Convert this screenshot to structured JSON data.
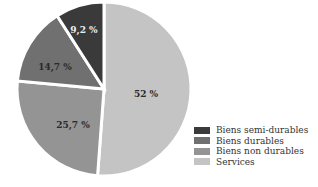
{
  "chart_data": {
    "type": "pie",
    "title": "",
    "categories": [
      "Biens semi-durables",
      "Biens durables",
      "Biens non durables",
      "Services"
    ],
    "values": [
      9.2,
      14.7,
      25.7,
      52
    ],
    "labels": [
      "9,2 %",
      "14,7 %",
      "25,7 %",
      "52 %"
    ],
    "colors": [
      "#3a3a3a",
      "#707070",
      "#949494",
      "#c4c4c4"
    ],
    "legend_position": "bottom-right"
  },
  "legend": {
    "items": [
      {
        "label": "Biens semi-durables",
        "color": "#3a3a3a"
      },
      {
        "label": "Biens durables",
        "color": "#707070"
      },
      {
        "label": "Biens non durables",
        "color": "#949494"
      },
      {
        "label": "Services",
        "color": "#c4c4c4"
      }
    ]
  }
}
